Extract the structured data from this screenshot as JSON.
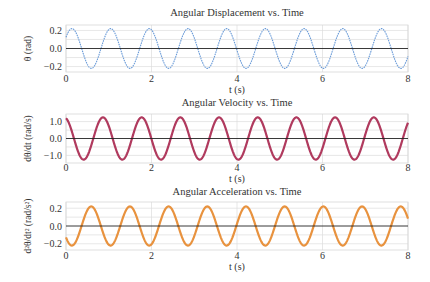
{
  "chart_data": [
    {
      "type": "line",
      "title": "Angular Displacement vs. Time",
      "xlabel": "t (s)",
      "ylabel": "θ (rad)",
      "xlim": [
        0,
        8
      ],
      "ylim": [
        -0.26,
        0.26
      ],
      "xticks": [
        0,
        2,
        4,
        6,
        8
      ],
      "xtick_labels": [
        "0",
        "2",
        "4",
        "6",
        "8"
      ],
      "yticks": [
        0.2,
        0.0,
        -0.2
      ],
      "ytick_labels": [
        "0.2",
        "0.0",
        "−0.2"
      ],
      "grid": true,
      "color": "#6a9bd8",
      "line_width": 1.1,
      "dashed": true,
      "series": [
        {
          "name": "θ(t)",
          "amplitude": 0.22,
          "period": 0.905,
          "peak_time": 0.14
        }
      ]
    },
    {
      "type": "line",
      "title": "Angular Velocity vs. Time",
      "xlabel": "t (s)",
      "ylabel": "dθ/dt (rad/s)",
      "xlim": [
        0,
        8
      ],
      "ylim": [
        -1.45,
        1.45
      ],
      "xticks": [
        0,
        2,
        4,
        6,
        8
      ],
      "xtick_labels": [
        "0",
        "2",
        "4",
        "6",
        "8"
      ],
      "yticks": [
        1.0,
        0.0,
        -1.0
      ],
      "ytick_labels": [
        "1.0",
        "0.0",
        "−1.0"
      ],
      "grid": true,
      "color": "#b03a5e",
      "line_width": 2.2,
      "dashed": false,
      "series": [
        {
          "name": "dθ/dt(t)",
          "amplitude": 1.25,
          "period": 0.905,
          "peak_time": -0.04
        }
      ]
    },
    {
      "type": "line",
      "title": "Angular Acceleration vs. Time",
      "xlabel": "t (s)",
      "ylabel": "d²θ/dt² (rad/s²)",
      "xlim": [
        0,
        8
      ],
      "ylim": [
        -0.27,
        0.27
      ],
      "xticks": [
        0,
        2,
        4,
        6,
        8
      ],
      "xtick_labels": [
        "0",
        "2",
        "4",
        "6",
        "8"
      ],
      "yticks": [
        0.2,
        0.0,
        -0.2
      ],
      "ytick_labels": [
        "0.2",
        "0.0",
        "−0.2"
      ],
      "grid": true,
      "color": "#e8923e",
      "line_width": 2.2,
      "dashed": false,
      "series": [
        {
          "name": "d²θ/dt²(t)",
          "amplitude": 0.22,
          "period": 0.905,
          "peak_time": 0.59
        }
      ]
    }
  ],
  "layout": {
    "panels": [
      {
        "x0": 66,
        "x1": 408,
        "y0": 25,
        "y1": 72,
        "title_y": 16,
        "tick_y": 82,
        "xlabel_y": 93,
        "ylabel_x": 40
      },
      {
        "x0": 66,
        "x1": 408,
        "y0": 114,
        "y1": 163,
        "title_y": 106,
        "tick_y": 171,
        "xlabel_y": 182,
        "ylabel_x": 40
      },
      {
        "x0": 66,
        "x1": 408,
        "y0": 202,
        "y1": 250,
        "title_y": 195,
        "tick_y": 259,
        "xlabel_y": 270,
        "ylabel_x": 40
      }
    ]
  }
}
